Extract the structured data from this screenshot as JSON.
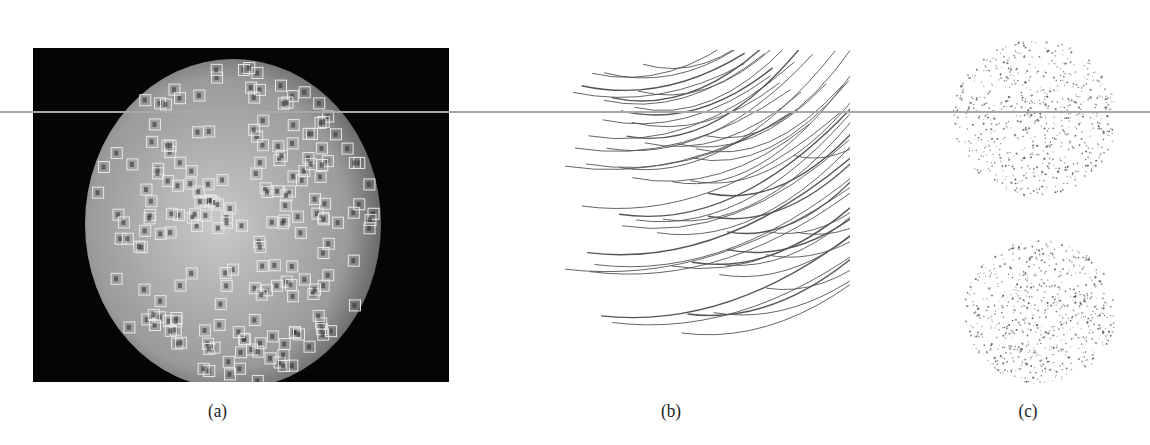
{
  "figure": {
    "panels": [
      {
        "id": "a",
        "caption": "(a)",
        "description": "grayscale circular image with square detection boxes on dark background",
        "box_count_approx": 200
      },
      {
        "id": "b",
        "caption": "(b)",
        "description": "curved line tracks forming a partial sphere",
        "track_count_approx": 55
      },
      {
        "id": "c",
        "caption": "(c)",
        "description": "two circular dot-cloud distributions stacked vertically"
      }
    ]
  },
  "colors": {
    "background": "#ffffff",
    "panel_a_bg": "#050505",
    "disc_center": "#c9c9c9",
    "disc_edge": "#6a6a6a",
    "box_stroke": "#e8e8e8",
    "track_stroke": "#555555",
    "dot_fill": "#444444",
    "rule_line": "#a8a8a8"
  }
}
